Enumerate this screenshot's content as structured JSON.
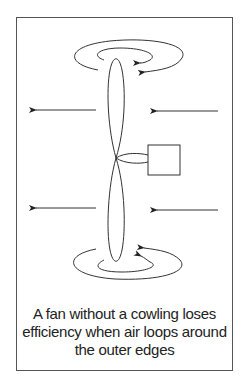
{
  "figure": {
    "caption_lines": [
      "A fan without a cowling loses",
      "efficiency when air loops around",
      "the outer edges"
    ],
    "elements": {
      "fan_blade_top": "upper fan blade",
      "fan_blade_bottom": "lower fan blade",
      "motor": "motor box",
      "airflow_arrows": [
        "left-pointing arrow upper-left",
        "left-pointing arrow upper-right",
        "left-pointing arrow lower-left",
        "left-pointing arrow lower-right"
      ],
      "vortex_loops": [
        "outer loop top",
        "inner loop top",
        "outer loop bottom",
        "inner loop bottom"
      ]
    },
    "colors": {
      "line": "#333333",
      "frame": "#555555",
      "text": "#222222"
    }
  }
}
